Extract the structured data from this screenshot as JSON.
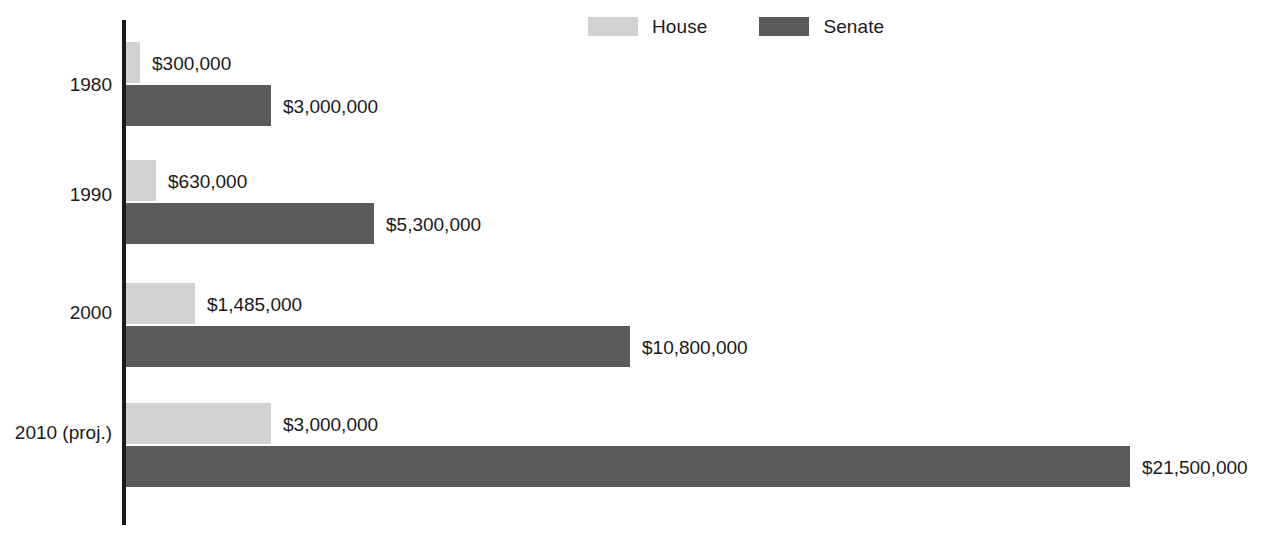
{
  "legend": {
    "position": "top-center",
    "items": [
      {
        "label": "House",
        "color": "#d2d2d2",
        "swatch_name": "house-legend-swatch"
      },
      {
        "label": "Senate",
        "color": "#5b5b5b",
        "swatch_name": "senate-legend-swatch"
      }
    ]
  },
  "chart_data": {
    "type": "bar",
    "orientation": "horizontal",
    "title": "",
    "subtitle": "",
    "xlabel": "",
    "ylabel": "",
    "grid": false,
    "legend_position": "top-center",
    "axis_min": 0,
    "axis_max": 21500000,
    "categories": [
      "1980",
      "1990",
      "2000",
      "2010 (proj.)"
    ],
    "series": [
      {
        "name": "House",
        "color": "#d2d2d2",
        "values": [
          300000,
          630000,
          1485000,
          3000000
        ],
        "labels": [
          "$300,000",
          "$630,000",
          "$1,485,000",
          "$3,000,000"
        ]
      },
      {
        "name": "Senate",
        "color": "#5b5b5b",
        "values": [
          3000000,
          5300000,
          10800000,
          21500000
        ],
        "labels": [
          "$3,000,000",
          "$5,300,000",
          "$10,800,000",
          "$21,500,000"
        ]
      }
    ]
  },
  "groups": [
    {
      "category": "1980",
      "label_top": 75,
      "house": {
        "value_label": "$300,000",
        "top": 42,
        "width": 14
      },
      "senate": {
        "value_label": "$3,000,000",
        "top": 85,
        "width": 145
      }
    },
    {
      "category": "1990",
      "label_top": 185,
      "house": {
        "value_label": "$630,000",
        "top": 160,
        "width": 30
      },
      "senate": {
        "value_label": "$5,300,000",
        "top": 203,
        "width": 248
      }
    },
    {
      "category": "2000",
      "label_top": 303,
      "house": {
        "value_label": "$1,485,000",
        "top": 283,
        "width": 69
      },
      "senate": {
        "value_label": "$10,800,000",
        "top": 326,
        "width": 504
      }
    },
    {
      "category": "2010 (proj.)",
      "label_top": 423,
      "house": {
        "value_label": "$3,000,000",
        "top": 403,
        "width": 145
      },
      "senate": {
        "value_label": "$21,500,000",
        "top": 446,
        "width": 1004
      }
    }
  ]
}
